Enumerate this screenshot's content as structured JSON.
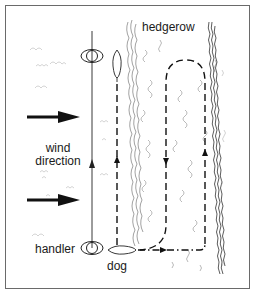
{
  "diagram": {
    "labels": {
      "hedgerow": "hedgerow",
      "wind_line1": "wind",
      "wind_line2": "direction",
      "handler": "handler",
      "dog": "dog"
    },
    "colors": {
      "ink": "#1a1a1a",
      "border": "#6a6a6a",
      "vegetation": "#8a8a8a",
      "background": "#ffffff"
    },
    "icons": {
      "handler_start": "handler-top-view",
      "handler_end": "handler-top-view",
      "dog_start": "dog-top-view",
      "dog_end": "dog-top-view",
      "wind_arrows": "right-arrow",
      "path_arrows": "direction-arrowheads"
    }
  }
}
